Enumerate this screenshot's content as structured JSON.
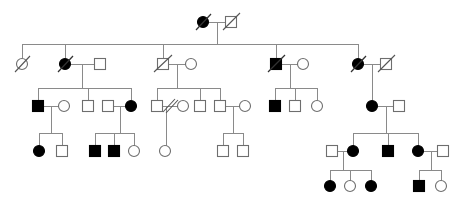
{
  "diagram": {
    "type": "pedigree-chart",
    "title": "",
    "width": 465,
    "height": 202,
    "background_color": "#ffffff",
    "line_color": "#8a8a8a",
    "symbol_stroke_color": "#6e6e6e",
    "affected_fill_color": "#000000",
    "unaffected_fill_color": "#ffffff",
    "legend_shown": false,
    "symbol_size": 11,
    "notation": {
      "square": "male",
      "circle": "female",
      "filled": "affected",
      "open": "unaffected",
      "single-slash": "deceased",
      "double-slash": "divorced-or-separated"
    },
    "generations": [
      {
        "id": "I",
        "y": 22,
        "individuals": [
          {
            "id": "I-1",
            "sex": "female",
            "shape": "circle",
            "affected": true,
            "deceased": true,
            "x": 203,
            "y": 22
          },
          {
            "id": "I-2",
            "sex": "male",
            "shape": "square",
            "affected": false,
            "deceased": true,
            "x": 231,
            "y": 22
          }
        ]
      },
      {
        "id": "II",
        "y": 64,
        "individuals": [
          {
            "id": "II-1",
            "sex": "female",
            "shape": "circle",
            "affected": false,
            "deceased": true,
            "x": 22,
            "y": 64
          },
          {
            "id": "II-2",
            "sex": "female",
            "shape": "circle",
            "affected": true,
            "deceased": true,
            "x": 65,
            "y": 64
          },
          {
            "id": "II-3",
            "sex": "male",
            "shape": "square",
            "affected": false,
            "deceased": false,
            "x": 100,
            "y": 64
          },
          {
            "id": "II-4",
            "sex": "male",
            "shape": "square",
            "affected": false,
            "deceased": true,
            "x": 163,
            "y": 64
          },
          {
            "id": "II-5",
            "sex": "female",
            "shape": "circle",
            "affected": false,
            "deceased": false,
            "x": 191,
            "y": 64
          },
          {
            "id": "II-6",
            "sex": "male",
            "shape": "square",
            "affected": true,
            "deceased": true,
            "x": 276,
            "y": 64
          },
          {
            "id": "II-7",
            "sex": "female",
            "shape": "circle",
            "affected": false,
            "deceased": false,
            "x": 303,
            "y": 64
          },
          {
            "id": "II-8",
            "sex": "female",
            "shape": "circle",
            "affected": true,
            "deceased": true,
            "x": 358,
            "y": 64
          },
          {
            "id": "II-9",
            "sex": "male",
            "shape": "square",
            "affected": false,
            "deceased": true,
            "x": 386,
            "y": 64
          }
        ]
      },
      {
        "id": "III",
        "y": 106,
        "individuals": [
          {
            "id": "III-1",
            "sex": "male",
            "shape": "square",
            "affected": true,
            "deceased": false,
            "x": 38,
            "y": 106
          },
          {
            "id": "III-2",
            "sex": "female",
            "shape": "circle",
            "affected": false,
            "deceased": false,
            "x": 64,
            "y": 106
          },
          {
            "id": "III-3",
            "sex": "male",
            "shape": "square",
            "affected": false,
            "deceased": false,
            "x": 88,
            "y": 106
          },
          {
            "id": "III-4",
            "sex": "male",
            "shape": "square",
            "affected": false,
            "deceased": false,
            "x": 108,
            "y": 106
          },
          {
            "id": "III-5",
            "sex": "female",
            "shape": "circle",
            "affected": true,
            "deceased": false,
            "x": 131,
            "y": 106
          },
          {
            "id": "III-6",
            "sex": "male",
            "shape": "square",
            "affected": false,
            "deceased": false,
            "x": 157,
            "y": 106
          },
          {
            "id": "III-7",
            "sex": "female",
            "shape": "circle",
            "affected": false,
            "deceased": false,
            "x": 183,
            "y": 106
          },
          {
            "id": "III-8",
            "sex": "male",
            "shape": "square",
            "affected": false,
            "deceased": false,
            "x": 200,
            "y": 106
          },
          {
            "id": "III-9",
            "sex": "male",
            "shape": "square",
            "affected": false,
            "deceased": false,
            "x": 220,
            "y": 106
          },
          {
            "id": "III-10",
            "sex": "female",
            "shape": "circle",
            "affected": false,
            "deceased": false,
            "x": 245,
            "y": 106
          },
          {
            "id": "III-11",
            "sex": "male",
            "shape": "square",
            "affected": true,
            "deceased": false,
            "x": 275,
            "y": 106
          },
          {
            "id": "III-12",
            "sex": "male",
            "shape": "square",
            "affected": false,
            "deceased": false,
            "x": 295,
            "y": 106
          },
          {
            "id": "III-13",
            "sex": "female",
            "shape": "circle",
            "affected": false,
            "deceased": false,
            "x": 317,
            "y": 106
          },
          {
            "id": "III-14",
            "sex": "female",
            "shape": "circle",
            "affected": true,
            "deceased": false,
            "x": 372,
            "y": 106
          },
          {
            "id": "III-15",
            "sex": "male",
            "shape": "square",
            "affected": false,
            "deceased": false,
            "x": 399,
            "y": 106
          }
        ]
      },
      {
        "id": "IV",
        "y": 151,
        "individuals": [
          {
            "id": "IV-1",
            "sex": "female",
            "shape": "circle",
            "affected": true,
            "deceased": false,
            "x": 39,
            "y": 151
          },
          {
            "id": "IV-2",
            "sex": "male",
            "shape": "square",
            "affected": false,
            "deceased": false,
            "x": 62,
            "y": 151
          },
          {
            "id": "IV-3",
            "sex": "male",
            "shape": "square",
            "affected": true,
            "deceased": false,
            "x": 95,
            "y": 151
          },
          {
            "id": "IV-4",
            "sex": "male",
            "shape": "square",
            "affected": true,
            "deceased": false,
            "x": 114,
            "y": 151
          },
          {
            "id": "IV-5",
            "sex": "female",
            "shape": "circle",
            "affected": false,
            "deceased": false,
            "x": 134,
            "y": 151
          },
          {
            "id": "IV-6",
            "sex": "female",
            "shape": "circle",
            "affected": false,
            "deceased": false,
            "x": 165,
            "y": 151
          },
          {
            "id": "IV-7",
            "sex": "male",
            "shape": "square",
            "affected": false,
            "deceased": false,
            "x": 223,
            "y": 151
          },
          {
            "id": "IV-8",
            "sex": "male",
            "shape": "square",
            "affected": false,
            "deceased": false,
            "x": 243,
            "y": 151
          },
          {
            "id": "IV-9",
            "sex": "male",
            "shape": "square",
            "affected": false,
            "deceased": false,
            "x": 332,
            "y": 151
          },
          {
            "id": "IV-10",
            "sex": "female",
            "shape": "circle",
            "affected": true,
            "deceased": false,
            "x": 353,
            "y": 151
          },
          {
            "id": "IV-11",
            "sex": "male",
            "shape": "square",
            "affected": true,
            "deceased": false,
            "x": 388,
            "y": 151
          },
          {
            "id": "IV-12",
            "sex": "female",
            "shape": "circle",
            "affected": true,
            "deceased": false,
            "x": 418,
            "y": 151
          },
          {
            "id": "IV-13",
            "sex": "male",
            "shape": "square",
            "affected": false,
            "deceased": false,
            "x": 443,
            "y": 151
          }
        ]
      },
      {
        "id": "V",
        "y": 186,
        "individuals": [
          {
            "id": "V-1",
            "sex": "female",
            "shape": "circle",
            "affected": true,
            "deceased": false,
            "x": 330,
            "y": 186
          },
          {
            "id": "V-2",
            "sex": "female",
            "shape": "circle",
            "affected": false,
            "deceased": false,
            "x": 350,
            "y": 186
          },
          {
            "id": "V-3",
            "sex": "female",
            "shape": "circle",
            "affected": true,
            "deceased": false,
            "x": 371,
            "y": 186
          },
          {
            "id": "V-4",
            "sex": "male",
            "shape": "square",
            "affected": true,
            "deceased": false,
            "x": 419,
            "y": 186
          },
          {
            "id": "V-5",
            "sex": "female",
            "shape": "circle",
            "affected": false,
            "deceased": false,
            "x": 441,
            "y": 186
          }
        ]
      }
    ],
    "counts": {
      "total_individuals": 44,
      "affected_individuals": 16,
      "deceased_individuals": 9,
      "generations": 5
    }
  }
}
